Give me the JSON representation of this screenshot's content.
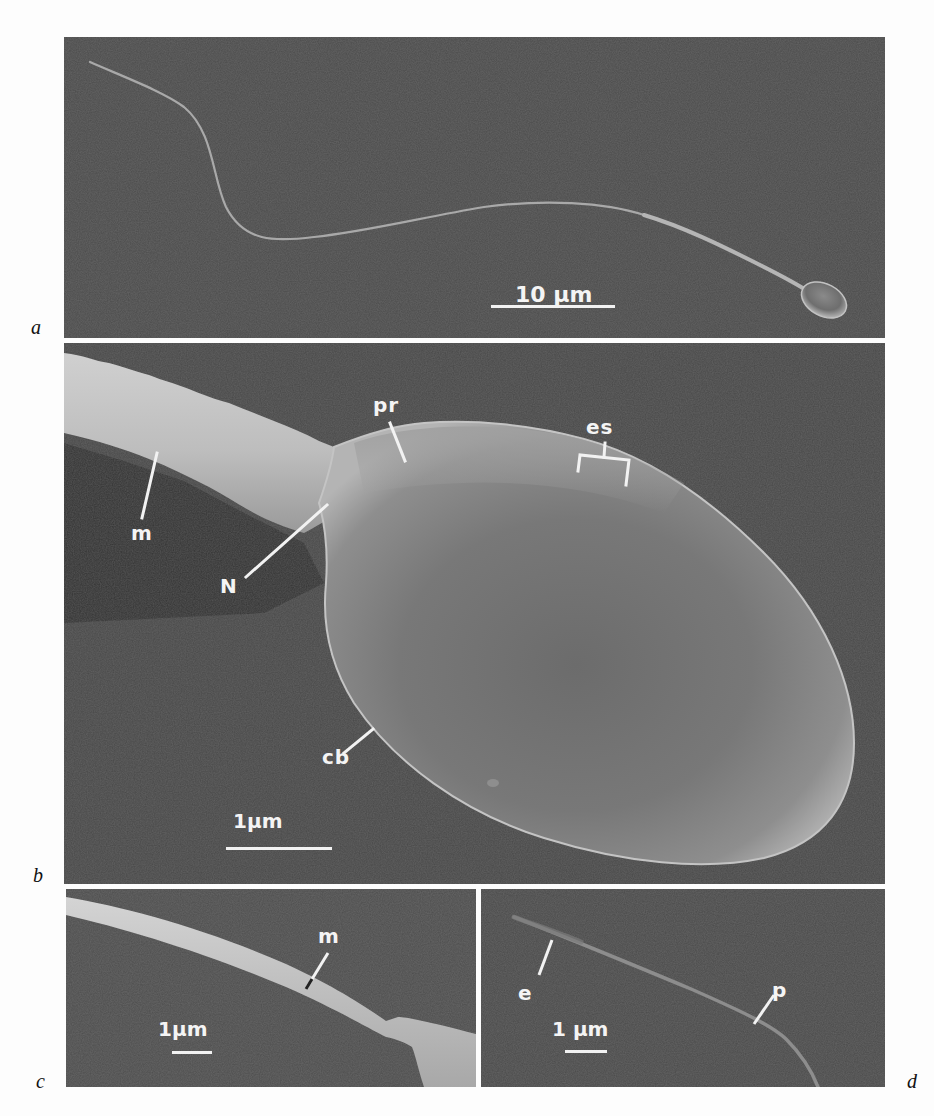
{
  "figure": {
    "panels": [
      {
        "id": "a",
        "label": "a",
        "scale_bar": "10 µm",
        "annotations": []
      },
      {
        "id": "b",
        "label": "b",
        "scale_bar": "1µm",
        "annotations": [
          {
            "key": "pr",
            "text": "pr"
          },
          {
            "key": "es",
            "text": "es"
          },
          {
            "key": "m",
            "text": "m"
          },
          {
            "key": "N",
            "text": "N"
          },
          {
            "key": "cb",
            "text": "cb"
          }
        ]
      },
      {
        "id": "c",
        "label": "c",
        "scale_bar": "1µm",
        "annotations": [
          {
            "key": "m",
            "text": "m"
          }
        ]
      },
      {
        "id": "d",
        "label": "d",
        "scale_bar": "1 µm",
        "annotations": [
          {
            "key": "e",
            "text": "e"
          },
          {
            "key": "p",
            "text": "p"
          }
        ]
      }
    ],
    "colors": {
      "background": "#4a4a4a",
      "specimen": "#b8b8b8",
      "label": "#f4f4f4",
      "page": "#fdfdfd"
    }
  }
}
